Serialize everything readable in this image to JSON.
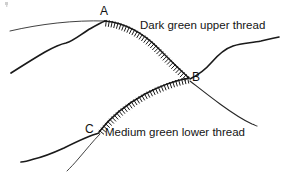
{
  "figure": {
    "title": "",
    "background_color": "#ffffff",
    "stroke_color": "#1a1a1a",
    "canvas": {
      "width": 282,
      "height": 172
    }
  },
  "nodes": [
    {
      "id": "A",
      "label": "A",
      "x": 105,
      "y": 20,
      "name": "node-label-a"
    },
    {
      "id": "B",
      "label": "B",
      "x": 189,
      "y": 78,
      "name": "node-label-b"
    },
    {
      "id": "C",
      "label": "C",
      "x": 99,
      "y": 132,
      "name": "node-label-c"
    }
  ],
  "annotations": [
    {
      "id": "upper",
      "text": "Dark green upper thread",
      "x": 140,
      "y": 19,
      "name": "annotation-dark-green-upper-thread"
    },
    {
      "id": "lower",
      "text": "Medium green lower thread",
      "x": 105,
      "y": 126,
      "name": "annotation-medium-green-lower-thread"
    }
  ],
  "chart_data": {
    "type": "diagram",
    "stitched_segments": [
      {
        "id": "A-B",
        "from": "A",
        "to": "B",
        "label": "Dark green upper thread",
        "curvature": "bows downward-left (concave up-right)",
        "hatch_side": "outer / upper-right",
        "hatch_count": 34,
        "path": "M105,20 C130,24 158,42 176,62 L189,78"
      },
      {
        "id": "C-B",
        "from": "C",
        "to": "B",
        "label": "Medium green lower thread",
        "curvature": "bows upward-right (convex up)",
        "hatch_side": "outer / upper-left",
        "hatch_count": 34,
        "path": "M99,132 C112,116 140,96 168,86 L189,78"
      }
    ],
    "plain_strands": [
      {
        "id": "strand-thin-left-to-A",
        "weight": "thin",
        "path": "M10,31 C40,24 74,20 105,21"
      },
      {
        "id": "strand-thick-lowerleft-to-A",
        "weight": "thick",
        "path": "M11,73 C33,60 56,47 66,43 C76,39 87,29 105,21"
      },
      {
        "id": "strand-B-to-upper-right",
        "weight": "thick",
        "path": "M189,78 C205,69 218,52 236,46 C252,41 268,41 279,38"
      },
      {
        "id": "strand-B-to-lower-right",
        "weight": "thin",
        "path": "M190,80 C207,89 224,102 240,113 C248,119 253,123 257,126"
      },
      {
        "id": "strand-C-to-lower-left",
        "weight": "thick",
        "path": "M99,133 C80,138 58,148 41,155 C31,159 26,161 22,162"
      },
      {
        "id": "strand-C-thin-tail",
        "weight": "thin",
        "path": "M100,134 C90,143 80,153 72,163 C69,166 68,168 67,170"
      }
    ],
    "icon_names": [
      "stitch-hatch-icon",
      "thread-strand-icon"
    ]
  }
}
